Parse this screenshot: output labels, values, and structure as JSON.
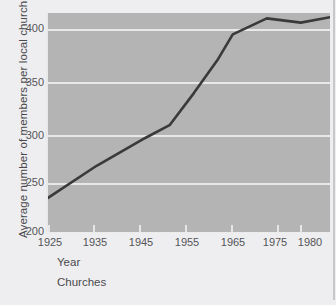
{
  "chart_data": {
    "type": "line",
    "title": "",
    "subtitle": "",
    "caption": "Churches",
    "xlabel": "Year",
    "ylabel": "Average number of members  per local church",
    "xlim": [
      1925,
      1983
    ],
    "ylim": [
      200,
      405
    ],
    "xticks": [
      1925,
      1935,
      1945,
      1955,
      1965,
      1975,
      1980
    ],
    "xtick_labels": [
      "1925",
      "1935",
      "1945",
      "1955",
      "1965",
      "1975",
      "1980"
    ],
    "yticks": [
      200,
      250,
      300,
      350,
      400
    ],
    "ytick_labels": [
      "200",
      "250",
      "300",
      "350",
      "400"
    ],
    "grid": "horizontal",
    "legend": "none",
    "series": [
      {
        "name": "Average members per local church",
        "x": [
          1925,
          1935,
          1945,
          1950,
          1955,
          1960,
          1963,
          1970,
          1977,
          1983
        ],
        "values": [
          232,
          262,
          288,
          300,
          330,
          362,
          385,
          400,
          396,
          401
        ]
      }
    ]
  },
  "colors": {
    "plot_background": "#b4b4b4",
    "figure_background": "#eeeef0",
    "gridline": "#e8e8e8",
    "line": "#3a3a3c",
    "tick_text": "#555558",
    "label_text": "#4a4a4d"
  },
  "axes": {
    "y_title": "Average number of members  per local church",
    "x_title": "Year"
  },
  "footer": {
    "caption": "Churches"
  }
}
